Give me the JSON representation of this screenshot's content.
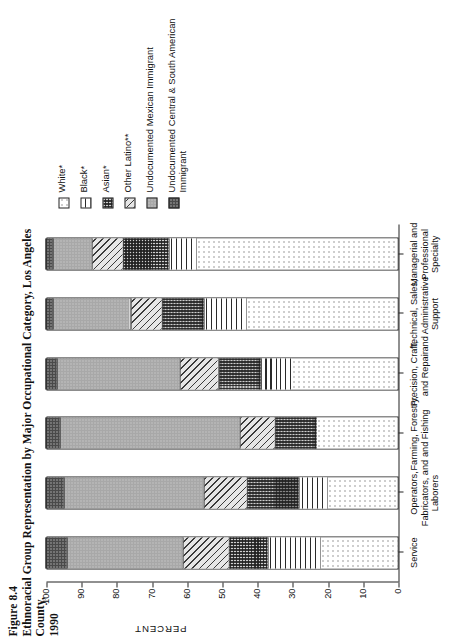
{
  "figure": {
    "number_label": "Figure 8.4",
    "title_line1": "Ethnoracial Group Representation by Major Occupational Category, Los Angeles County,",
    "title_line2": "1990"
  },
  "legend": {
    "position": "top-right",
    "items": [
      {
        "label": "White*",
        "pattern": "p-white",
        "swatch_name": "legend-swatch-white"
      },
      {
        "label": "Black*",
        "pattern": "p-black",
        "swatch_name": "legend-swatch-black"
      },
      {
        "label": "Asian*",
        "pattern": "p-asian",
        "swatch_name": "legend-swatch-asian"
      },
      {
        "label": "Other Latino**",
        "pattern": "p-otherlatino",
        "swatch_name": "legend-swatch-other-latino"
      },
      {
        "label": "Undocumented Mexican Immigrant",
        "pattern": "p-undocmex",
        "swatch_name": "legend-swatch-undocumented-mexican"
      },
      {
        "label": "Undocumented Central & South American Immigrant",
        "pattern": "p-undoccsa",
        "swatch_name": "legend-swatch-undocumented-central-south-american"
      }
    ]
  },
  "chart_data": {
    "type": "bar",
    "subtype": "stacked-vertical-100percent",
    "title": "Ethnoracial Group Representation by Major Occupational Category, Los Angeles County, 1990",
    "xlabel": "OCCUPATIONAL CATEGORY",
    "ylabel": "PERCENT",
    "ylim": [
      0,
      100
    ],
    "yticks": [
      0,
      10,
      20,
      30,
      40,
      50,
      60,
      70,
      80,
      90,
      100
    ],
    "ytick_labels": [
      "0",
      "10",
      "20",
      "30",
      "40",
      "50",
      "60",
      "70",
      "80",
      "90",
      "100"
    ],
    "grid": false,
    "categories": [
      "Service",
      "Operators, Fabricators, and Laborers",
      "Farming, Forestry, and Fishing",
      "Precision, Craft, and Repair",
      "Technical, Sales, and Administrative Support",
      "Managerial and Professional Specialty"
    ],
    "category_labels_wrapped": [
      [
        "Service"
      ],
      [
        "Operators,",
        "Fabricators, and",
        "Laborers"
      ],
      [
        "Farming, Forestry,",
        "and Fishing"
      ],
      [
        "Precision, Craft,",
        "and Repair"
      ],
      [
        "Technical, Sales,",
        "and Administrative",
        "Support"
      ],
      [
        "Managerial and",
        "Professional",
        "Specialty"
      ]
    ],
    "series": [
      {
        "name": "White*",
        "pattern": "p-white",
        "values": [
          22,
          20,
          23,
          30,
          43,
          57
        ]
      },
      {
        "name": "Black*",
        "pattern": "p-black",
        "values": [
          15,
          8,
          0,
          9,
          12,
          8
        ]
      },
      {
        "name": "Asian*",
        "pattern": "p-asian",
        "values": [
          11,
          15,
          12,
          12,
          12,
          13
        ]
      },
      {
        "name": "Other Latino**",
        "pattern": "p-otherlatino",
        "values": [
          13,
          12,
          10,
          11,
          9,
          9
        ]
      },
      {
        "name": "Undocumented Mexican Immigrant",
        "pattern": "p-undocmex",
        "values": [
          33,
          40,
          51,
          35,
          22,
          11
        ]
      },
      {
        "name": "Undocumented Central & South American Immigrant",
        "pattern": "p-undoccsa",
        "values": [
          6,
          5,
          4,
          3,
          2,
          2
        ]
      }
    ]
  }
}
